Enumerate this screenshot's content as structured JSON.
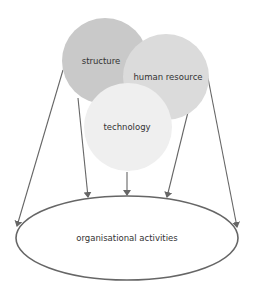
{
  "diagram": {
    "type": "venn-to-outcome",
    "circles": [
      {
        "id": "structure",
        "label": "structure",
        "color": "#c9c9c9"
      },
      {
        "id": "human-resource",
        "label": "human resource",
        "color": "#dbdbdb"
      },
      {
        "id": "technology",
        "label": "technology",
        "color": "#efefef"
      }
    ],
    "target": {
      "label": "organisational activities",
      "stroke": "#666666"
    },
    "arrow_color": "#666666",
    "arrows": [
      {
        "from": "structure",
        "to": "organisational activities"
      },
      {
        "from": "structure",
        "to": "organisational activities"
      },
      {
        "from": "technology",
        "to": "organisational activities"
      },
      {
        "from": "human resource",
        "to": "organisational activities"
      },
      {
        "from": "human resource",
        "to": "organisational activities"
      }
    ]
  }
}
